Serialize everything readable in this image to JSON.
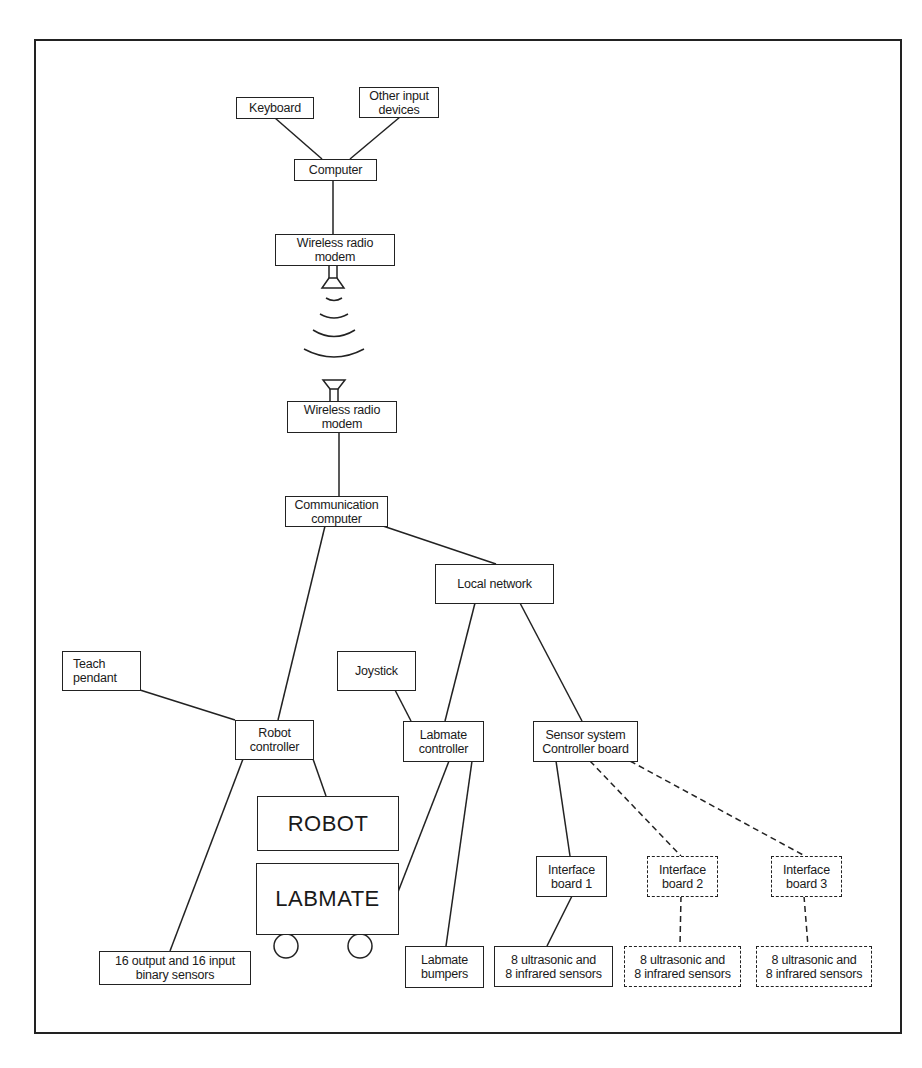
{
  "diagram": {
    "title": "",
    "nodes": {
      "keyboard": {
        "label": "Keyboard"
      },
      "other_input": {
        "label": "Other input\ndevices"
      },
      "computer": {
        "label": "Computer"
      },
      "modem_top": {
        "label": "Wireless radio\nmodem"
      },
      "modem_bottom": {
        "label": "Wireless radio\nmodem"
      },
      "comm_computer": {
        "label": "Communication\ncomputer"
      },
      "local_network": {
        "label": "Local network"
      },
      "teach_pendant": {
        "label": "Teach\npendant"
      },
      "robot_controller": {
        "label": "Robot\ncontroller"
      },
      "joystick": {
        "label": "Joystick"
      },
      "labmate_controller": {
        "label": "Labmate\ncontroller"
      },
      "sensor_controller": {
        "label": "Sensor system\nController board"
      },
      "robot": {
        "label": "ROBOT"
      },
      "labmate": {
        "label": "LABMATE"
      },
      "binary_sensors": {
        "label": "16 output and 16 input\nbinary sensors"
      },
      "labmate_bumpers": {
        "label": "Labmate\nbumpers"
      },
      "interface_1": {
        "label": "Interface\nboard 1"
      },
      "interface_2": {
        "label": "Interface\nboard 2"
      },
      "interface_3": {
        "label": "Interface\nboard 3"
      },
      "sensors_1": {
        "label": "8 ultrasonic and\n8 infrared sensors"
      },
      "sensors_2": {
        "label": "8 ultrasonic and\n8 infrared sensors"
      },
      "sensors_3": {
        "label": "8 ultrasonic and\n8 infrared sensors"
      }
    },
    "edges": [
      {
        "from": "keyboard",
        "to": "computer",
        "style": "solid"
      },
      {
        "from": "other_input",
        "to": "computer",
        "style": "solid"
      },
      {
        "from": "computer",
        "to": "modem_top",
        "style": "solid"
      },
      {
        "from": "modem_top",
        "to": "modem_bottom",
        "style": "wireless"
      },
      {
        "from": "modem_bottom",
        "to": "comm_computer",
        "style": "solid"
      },
      {
        "from": "comm_computer",
        "to": "local_network",
        "style": "solid"
      },
      {
        "from": "comm_computer",
        "to": "robot_controller",
        "style": "solid"
      },
      {
        "from": "teach_pendant",
        "to": "robot_controller",
        "style": "solid"
      },
      {
        "from": "robot_controller",
        "to": "robot",
        "style": "solid"
      },
      {
        "from": "robot_controller",
        "to": "binary_sensors",
        "style": "solid"
      },
      {
        "from": "local_network",
        "to": "labmate_controller",
        "style": "solid"
      },
      {
        "from": "local_network",
        "to": "sensor_controller",
        "style": "solid"
      },
      {
        "from": "joystick",
        "to": "labmate_controller",
        "style": "solid"
      },
      {
        "from": "labmate_controller",
        "to": "labmate",
        "style": "solid"
      },
      {
        "from": "labmate_controller",
        "to": "labmate_bumpers",
        "style": "solid"
      },
      {
        "from": "sensor_controller",
        "to": "interface_1",
        "style": "solid"
      },
      {
        "from": "sensor_controller",
        "to": "interface_2",
        "style": "dashed"
      },
      {
        "from": "sensor_controller",
        "to": "interface_3",
        "style": "dashed"
      },
      {
        "from": "interface_1",
        "to": "sensors_1",
        "style": "solid"
      },
      {
        "from": "interface_2",
        "to": "sensors_2",
        "style": "dashed"
      },
      {
        "from": "interface_3",
        "to": "sensors_3",
        "style": "dashed"
      }
    ],
    "colors": {
      "line": "#222222",
      "background": "#ffffff"
    }
  }
}
